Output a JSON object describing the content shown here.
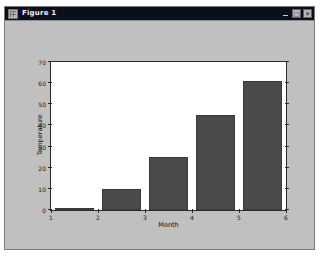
{
  "window": {
    "title": "Figure 1",
    "icon": "figure-window-icon",
    "controls": {
      "minimize": "_",
      "maximize": "□",
      "close": "✕"
    },
    "canvas_color": "#c0c0c0",
    "titlebar_color": "#0b0f1c"
  },
  "chart_data": {
    "type": "bar",
    "title": "",
    "xlabel": "Month",
    "ylabel": "Temperature",
    "categories": [
      "1",
      "2",
      "3",
      "4",
      "5"
    ],
    "x": [
      1,
      2,
      3,
      4,
      5
    ],
    "values": [
      1,
      10,
      25,
      45,
      61
    ],
    "xlim": [
      1,
      6
    ],
    "ylim": [
      0,
      70
    ],
    "xticks": [
      "1",
      "2",
      "3",
      "4",
      "5",
      "6"
    ],
    "yticks": [
      "0",
      "10",
      "20",
      "30",
      "40",
      "50",
      "60",
      "70"
    ],
    "grid": false,
    "legend": false,
    "bar_color": "#4a4a4a",
    "plot_background": "#ffffff",
    "axis_color": "#2b2b2b"
  }
}
